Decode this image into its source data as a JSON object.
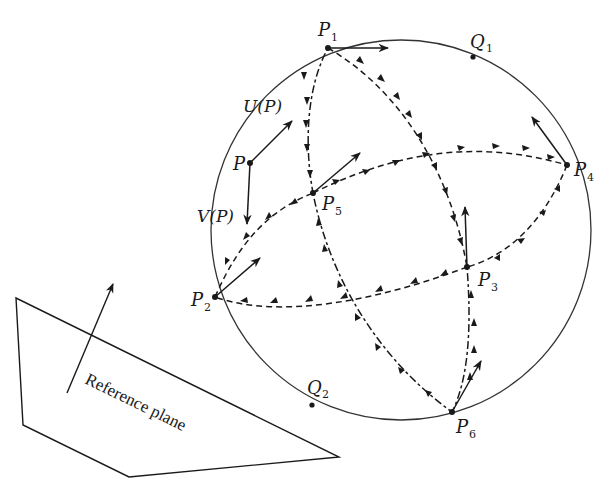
{
  "figure": {
    "sphere": {
      "cx": 401,
      "cy": 230,
      "r": 190,
      "stroke": "#333333"
    },
    "points": [
      {
        "id": "P1",
        "label": "P",
        "sub": "1",
        "x": 328,
        "y": 48,
        "lx": 318,
        "ly": 30
      },
      {
        "id": "Q1",
        "label": "Q",
        "sub": "1",
        "x": 473,
        "y": 57,
        "lx": 472,
        "ly": 43
      },
      {
        "id": "P4",
        "label": "P",
        "sub": "4",
        "x": 567,
        "y": 165,
        "lx": 576,
        "ly": 172
      },
      {
        "id": "P",
        "label": "P",
        "sub": "",
        "x": 250,
        "y": 163,
        "lx": 232,
        "ly": 168
      },
      {
        "id": "P5",
        "label": "P",
        "sub": "5",
        "x": 313,
        "y": 193,
        "lx": 322,
        "ly": 210
      },
      {
        "id": "P3",
        "label": "P",
        "sub": "3",
        "x": 467,
        "y": 267,
        "lx": 478,
        "ly": 285
      },
      {
        "id": "P2",
        "label": "P",
        "sub": "2",
        "x": 215,
        "y": 297,
        "lx": 192,
        "ly": 305
      },
      {
        "id": "Q2",
        "label": "Q",
        "sub": "2",
        "x": 312,
        "y": 405,
        "lx": 306,
        "ly": 394
      },
      {
        "id": "P6",
        "label": "P",
        "sub": "6",
        "x": 452,
        "y": 412,
        "lx": 456,
        "ly": 432
      }
    ],
    "labels": {
      "u_of_p": "U(P)",
      "v_of_p": "V(P)",
      "reference_plane": "Reference plane"
    },
    "colors": {
      "ink": "#1a1a1a",
      "background": "#ffffff"
    }
  }
}
